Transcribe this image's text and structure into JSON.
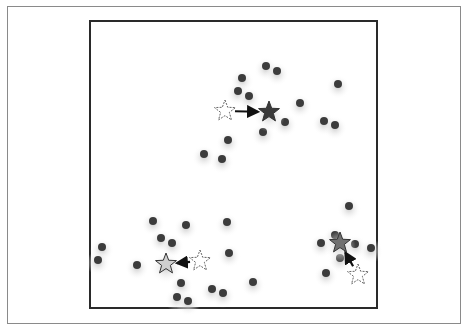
{
  "figure": {
    "colors": {
      "point": "#3c3c3c",
      "arrow": "#111111",
      "hollow_star_stroke": "#555555",
      "glow": "#bdbdbd"
    }
  },
  "chart_data": {
    "type": "scatter",
    "title": "",
    "xlabel": "",
    "ylabel": "",
    "grid": false,
    "legend": null,
    "points": [
      {
        "x": 266,
        "y": 66
      },
      {
        "x": 277,
        "y": 71
      },
      {
        "x": 242,
        "y": 78
      },
      {
        "x": 238,
        "y": 91
      },
      {
        "x": 249,
        "y": 96
      },
      {
        "x": 300,
        "y": 103
      },
      {
        "x": 338,
        "y": 84
      },
      {
        "x": 285,
        "y": 122
      },
      {
        "x": 324,
        "y": 121
      },
      {
        "x": 335,
        "y": 125
      },
      {
        "x": 263,
        "y": 132
      },
      {
        "x": 228,
        "y": 140
      },
      {
        "x": 204,
        "y": 154
      },
      {
        "x": 222,
        "y": 159
      },
      {
        "x": 153,
        "y": 221
      },
      {
        "x": 186,
        "y": 225
      },
      {
        "x": 227,
        "y": 222
      },
      {
        "x": 161,
        "y": 238
      },
      {
        "x": 172,
        "y": 243
      },
      {
        "x": 102,
        "y": 247
      },
      {
        "x": 98,
        "y": 260
      },
      {
        "x": 137,
        "y": 265
      },
      {
        "x": 229,
        "y": 253
      },
      {
        "x": 181,
        "y": 283
      },
      {
        "x": 253,
        "y": 282
      },
      {
        "x": 212,
        "y": 289
      },
      {
        "x": 223,
        "y": 293
      },
      {
        "x": 177,
        "y": 297
      },
      {
        "x": 188,
        "y": 301
      },
      {
        "x": 349,
        "y": 206
      },
      {
        "x": 335,
        "y": 235
      },
      {
        "x": 321,
        "y": 243
      },
      {
        "x": 355,
        "y": 244
      },
      {
        "x": 371,
        "y": 248
      },
      {
        "x": 340,
        "y": 258
      },
      {
        "x": 326,
        "y": 273
      }
    ],
    "centroids": [
      {
        "name": "cluster-top",
        "old": {
          "x": 225,
          "y": 111
        },
        "new": {
          "x": 269,
          "y": 112
        },
        "fill": "#3a3a3a"
      },
      {
        "name": "cluster-bottom-left",
        "old": {
          "x": 200,
          "y": 261
        },
        "new": {
          "x": 166,
          "y": 264
        },
        "fill": "#cfcfcf"
      },
      {
        "name": "cluster-bottom-right",
        "old": {
          "x": 358,
          "y": 275
        },
        "new": {
          "x": 340,
          "y": 243
        },
        "fill": "#707070"
      }
    ],
    "coordinate_space": "screen pixels of 470x331 image"
  }
}
